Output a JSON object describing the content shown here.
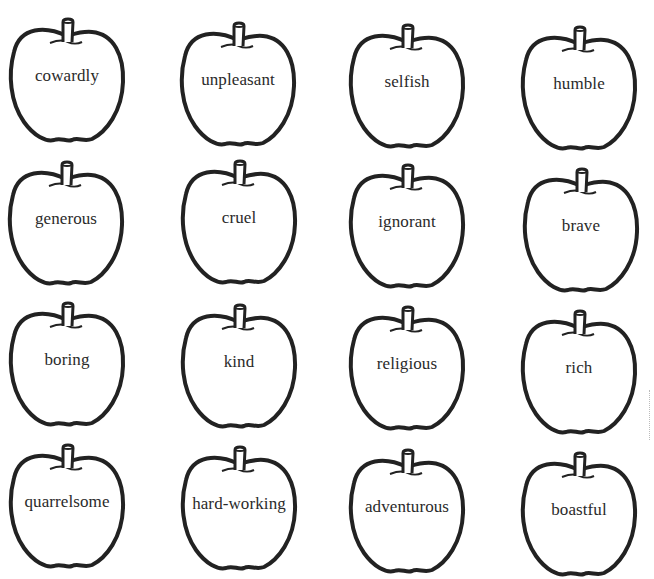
{
  "worksheet": {
    "rows": [
      {
        "apples": [
          {
            "word": "cowardly"
          },
          {
            "word": "unpleasant"
          },
          {
            "word": "selfish"
          },
          {
            "word": "humble"
          }
        ]
      },
      {
        "apples": [
          {
            "word": "generous"
          },
          {
            "word": "cruel"
          },
          {
            "word": "ignorant"
          },
          {
            "word": "brave"
          }
        ]
      },
      {
        "apples": [
          {
            "word": "boring"
          },
          {
            "word": "kind"
          },
          {
            "word": "religious"
          },
          {
            "word": "rich"
          }
        ]
      },
      {
        "apples": [
          {
            "word": "quarrelsome"
          },
          {
            "word": "hard-working"
          },
          {
            "word": "adventurous"
          },
          {
            "word": "boastful"
          }
        ]
      }
    ],
    "colors": {
      "outline": "#222222",
      "text": "#2a2a2a",
      "background": "#ffffff"
    }
  }
}
